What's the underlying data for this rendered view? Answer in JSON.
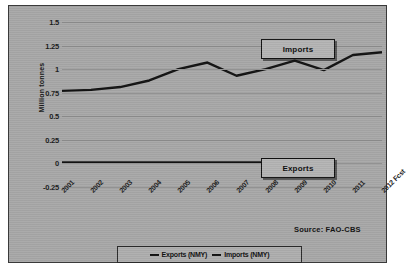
{
  "chart_data": {
    "type": "line",
    "title": "",
    "xlabel": "",
    "ylabel": "Million tonnes",
    "categories": [
      "2001",
      "2002",
      "2003",
      "2004",
      "2005",
      "2006",
      "2007",
      "2008",
      "2009",
      "2010",
      "2011",
      "2012 Fcst"
    ],
    "ylim": [
      -0.25,
      1.5
    ],
    "yticks": [
      "1.5",
      "1.25",
      "1",
      "0.75",
      "0.5",
      "0.25",
      "0",
      "-0.25"
    ],
    "ytick_values": [
      1.5,
      1.25,
      1,
      0.75,
      0.5,
      0.25,
      0,
      -0.25
    ],
    "grid": true,
    "legend_position": "bottom",
    "series": [
      {
        "name": "Exports (NMY)",
        "values": [
          0.01,
          0.01,
          0.01,
          0.01,
          0.01,
          0.01,
          0.01,
          0.01,
          0.01,
          0.01,
          null,
          null
        ],
        "color": "#121212"
      },
      {
        "name": "Imports (NMY)",
        "values": [
          0.77,
          0.78,
          0.81,
          0.88,
          1.0,
          1.07,
          0.93,
          1.0,
          1.09,
          0.99,
          1.15,
          1.18
        ],
        "color": "#121212"
      }
    ],
    "annotations": [
      {
        "label": "Imports",
        "target": "imports-series"
      },
      {
        "label": "Exports",
        "target": "exports-series"
      }
    ],
    "source": "Source: FAO-CBS"
  },
  "legend": {
    "items": [
      {
        "label": "Exports (NMY)"
      },
      {
        "label": "Imports (NMY)"
      }
    ]
  }
}
